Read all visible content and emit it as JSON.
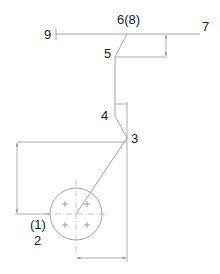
{
  "diagram": {
    "type": "mechanical-linkage-schematic",
    "labels": {
      "p9": "9",
      "p6": "6(8)",
      "p7": "7",
      "p5": "5",
      "p4": "4",
      "p3": "3",
      "p1": "(1)",
      "p2": "2"
    },
    "colors": {
      "line": "#8a8a8a",
      "text": "#222222",
      "background": "#ffffff"
    }
  }
}
